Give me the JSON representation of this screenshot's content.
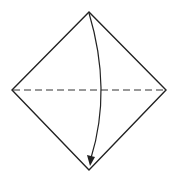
{
  "diagram": {
    "type": "origami-fold-step",
    "paper": {
      "shape": "diamond",
      "vertices": {
        "top": [
          89,
          12
        ],
        "right": [
          166,
          90
        ],
        "bottom": [
          89,
          170
        ],
        "left": [
          12,
          90
        ]
      },
      "stroke_color": "#222222"
    },
    "fold_line": {
      "style": "dashed",
      "type": "valley-fold",
      "from": [
        12,
        90
      ],
      "to": [
        166,
        90
      ],
      "dash_pattern": "7 4",
      "color": "#333333"
    },
    "arrow": {
      "direction": "top-to-bottom",
      "start": [
        89,
        12
      ],
      "control": [
        110,
        90
      ],
      "end": [
        91,
        165
      ],
      "color": "#222222"
    }
  }
}
